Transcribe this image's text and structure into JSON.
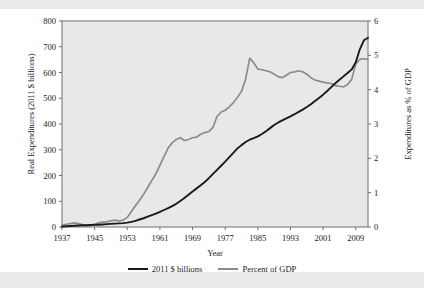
{
  "figure": {
    "background_color": "#ffffff",
    "plot_background_color": "#e8e8e8",
    "band_color": "#ebebeb",
    "series_colors": {
      "dollars": "#1a1a1a",
      "gdp": "#8c8c8c"
    }
  },
  "chart_data": {
    "type": "line",
    "title": "",
    "xlabel": "Year",
    "ylabel": "Real Expenditures (2011 $ billions)",
    "ylabel_right": "Expenditures as % of GDP",
    "xlim": [
      1937,
      2012
    ],
    "ylim": [
      0,
      800
    ],
    "ylim_right": [
      0,
      6
    ],
    "grid": false,
    "legend_position": "bottom",
    "xticks": [
      1937,
      1945,
      1953,
      1961,
      1969,
      1977,
      1985,
      1993,
      2001,
      2009
    ],
    "yticks": [
      0,
      100,
      200,
      300,
      400,
      500,
      600,
      700,
      800
    ],
    "yticks_right": [
      0,
      1,
      2,
      3,
      4,
      5,
      6
    ],
    "series": [
      {
        "name": "2011 $ billions",
        "axis": "left",
        "color": "#1a1a1a",
        "x": [
          1937,
          1938,
          1939,
          1940,
          1941,
          1942,
          1943,
          1944,
          1945,
          1946,
          1947,
          1948,
          1949,
          1950,
          1951,
          1952,
          1953,
          1954,
          1955,
          1956,
          1957,
          1958,
          1959,
          1960,
          1961,
          1962,
          1963,
          1964,
          1965,
          1966,
          1967,
          1968,
          1969,
          1970,
          1971,
          1972,
          1973,
          1974,
          1975,
          1976,
          1977,
          1978,
          1979,
          1980,
          1981,
          1982,
          1983,
          1984,
          1985,
          1986,
          1987,
          1988,
          1989,
          1990,
          1991,
          1992,
          1993,
          1994,
          1995,
          1996,
          1997,
          1998,
          1999,
          2000,
          2001,
          2002,
          2003,
          2004,
          2005,
          2006,
          2007,
          2008,
          2009,
          2010,
          2011,
          2012
        ],
        "values": [
          2,
          3,
          4,
          5,
          6,
          7,
          7,
          8,
          9,
          9,
          10,
          11,
          12,
          13,
          14,
          15,
          17,
          20,
          24,
          29,
          34,
          40,
          46,
          52,
          59,
          66,
          73,
          81,
          90,
          101,
          113,
          125,
          138,
          150,
          162,
          175,
          190,
          206,
          222,
          238,
          254,
          271,
          288,
          305,
          318,
          330,
          339,
          345,
          352,
          361,
          372,
          384,
          396,
          406,
          414,
          422,
          430,
          438,
          447,
          456,
          466,
          477,
          489,
          501,
          514,
          528,
          543,
          558,
          572,
          585,
          598,
          612,
          640,
          690,
          725,
          735
        ]
      },
      {
        "name": "Percent of GDP",
        "axis": "right",
        "color": "#8c8c8c",
        "x": [
          1937,
          1938,
          1939,
          1940,
          1941,
          1942,
          1943,
          1944,
          1945,
          1946,
          1947,
          1948,
          1949,
          1950,
          1951,
          1952,
          1953,
          1954,
          1955,
          1956,
          1957,
          1958,
          1959,
          1960,
          1961,
          1962,
          1963,
          1964,
          1965,
          1966,
          1967,
          1968,
          1969,
          1970,
          1971,
          1972,
          1973,
          1974,
          1975,
          1976,
          1977,
          1978,
          1979,
          1980,
          1981,
          1982,
          1983,
          1984,
          1985,
          1986,
          1987,
          1988,
          1989,
          1990,
          1991,
          1992,
          1993,
          1994,
          1995,
          1996,
          1997,
          1998,
          1999,
          2000,
          2001,
          2002,
          2003,
          2004,
          2005,
          2006,
          2007,
          2008,
          2009,
          2010,
          2011,
          2012
        ],
        "values": [
          0.05,
          0.08,
          0.1,
          0.12,
          0.1,
          0.07,
          0.05,
          0.05,
          0.07,
          0.12,
          0.14,
          0.15,
          0.18,
          0.2,
          0.18,
          0.2,
          0.28,
          0.45,
          0.62,
          0.78,
          0.95,
          1.15,
          1.35,
          1.55,
          1.8,
          2.05,
          2.3,
          2.45,
          2.55,
          2.6,
          2.52,
          2.55,
          2.6,
          2.62,
          2.7,
          2.75,
          2.78,
          2.9,
          3.22,
          3.35,
          3.4,
          3.5,
          3.62,
          3.78,
          3.95,
          4.3,
          4.92,
          4.78,
          4.6,
          4.58,
          4.55,
          4.52,
          4.45,
          4.38,
          4.35,
          4.42,
          4.5,
          4.52,
          4.55,
          4.52,
          4.45,
          4.35,
          4.28,
          4.25,
          4.22,
          4.2,
          4.18,
          4.12,
          4.1,
          4.08,
          4.15,
          4.3,
          4.75,
          4.88,
          4.9,
          4.88
        ]
      }
    ]
  },
  "legend": {
    "entries": [
      {
        "label": "2011 $ billions",
        "swatch": "black-line-swatch"
      },
      {
        "label": "Percent of GDP",
        "swatch": "gray-line-swatch"
      }
    ]
  }
}
